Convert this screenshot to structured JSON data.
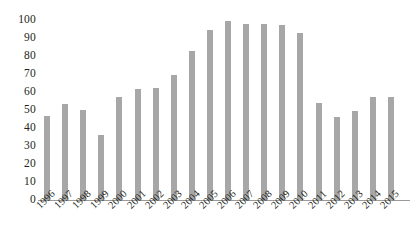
{
  "chart_data": {
    "type": "bar",
    "title": "",
    "subtitle": "",
    "xlabel": "",
    "ylabel": "",
    "categories": [
      "1996",
      "1997",
      "1998",
      "1999",
      "2000",
      "2001",
      "2002",
      "2003",
      "2004",
      "2005",
      "2006",
      "2007",
      "2008",
      "2009",
      "2010",
      "2011",
      "2012",
      "2013",
      "2014",
      "2015"
    ],
    "values": [
      46.5,
      53.5,
      50,
      36,
      57,
      61.5,
      62.5,
      69.5,
      83,
      94.5,
      99.5,
      98,
      98,
      97.5,
      93,
      54,
      46,
      49.5,
      57,
      57.5
    ],
    "ylim": [
      0,
      100
    ],
    "yticks": [
      0,
      10,
      20,
      30,
      40,
      50,
      60,
      70,
      80,
      90,
      100
    ],
    "ytick_labels": [
      "0",
      "10",
      "20",
      "30",
      "40",
      "50",
      "60",
      "70",
      "80",
      "90",
      "100"
    ],
    "grid": false,
    "legend": null,
    "legend_position": "none",
    "bar_color": "#a7a7a7",
    "axis_color": "#9b9b9b",
    "text_color": "#231f20",
    "background": "#ffffff",
    "xtick_rotation": -45
  }
}
